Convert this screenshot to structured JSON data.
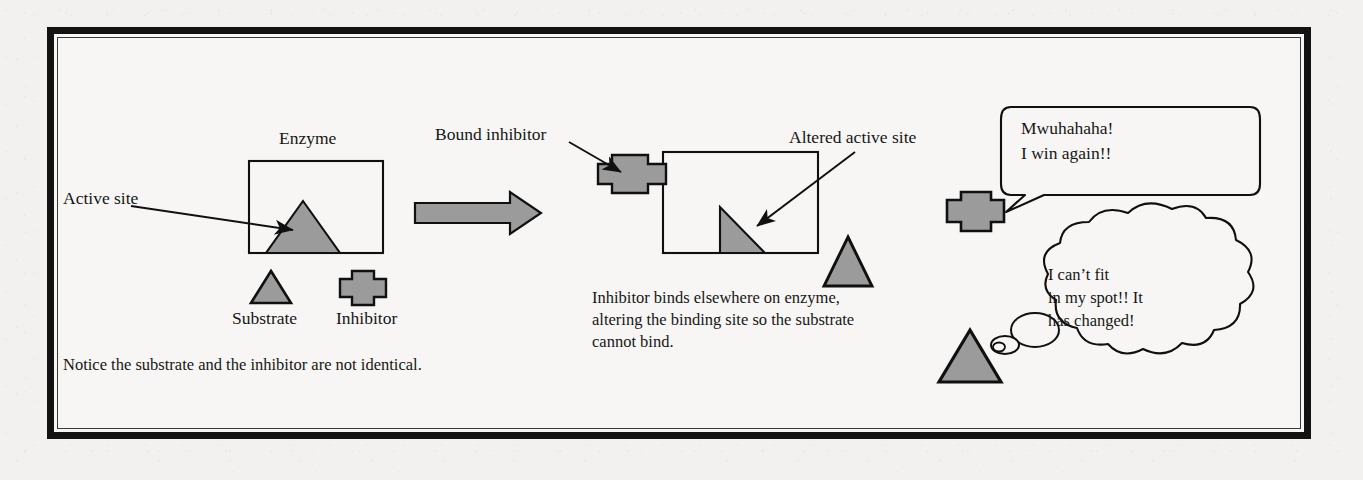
{
  "figure": {
    "title_labels": {
      "enzyme": "Enzyme",
      "active_site": "Active site",
      "substrate": "Substrate",
      "inhibitor": "Inhibitor",
      "bound_inhibitor": "Bound inhibitor",
      "altered_active_site": "Altered active site"
    },
    "captions": {
      "left": "Notice the substrate and the inhibitor are not identical.",
      "middle_line1": "Inhibitor binds elsewhere on enzyme,",
      "middle_line2": "altering the binding site so the substrate",
      "middle_line3": "cannot bind."
    },
    "speech_bubble": {
      "line1": "Mwuhahaha!",
      "line2": "I win again!!"
    },
    "thought_bubble": {
      "line1": "I can’t fit",
      "line2": "in my spot!! It",
      "line3": "has changed!"
    },
    "colors": {
      "shape_fill": "#9b9b9b",
      "outline": "#101010",
      "paper": "#f2f1ef",
      "frame": "#121212"
    },
    "shapes": [
      {
        "name": "enzyme-box-left",
        "type": "rectangle"
      },
      {
        "name": "active-site-triangle",
        "type": "triangle"
      },
      {
        "name": "substrate-triangle-left",
        "type": "triangle"
      },
      {
        "name": "inhibitor-shape-left",
        "type": "cross"
      },
      {
        "name": "transition-arrow",
        "type": "arrow"
      },
      {
        "name": "bound-inhibitor-shape",
        "type": "cross"
      },
      {
        "name": "enzyme-box-right",
        "type": "rectangle"
      },
      {
        "name": "altered-active-site-triangle",
        "type": "right-triangle"
      },
      {
        "name": "substrate-triangle-middle",
        "type": "triangle"
      },
      {
        "name": "inhibitor-character",
        "type": "cross"
      },
      {
        "name": "substrate-character",
        "type": "triangle"
      }
    ]
  }
}
